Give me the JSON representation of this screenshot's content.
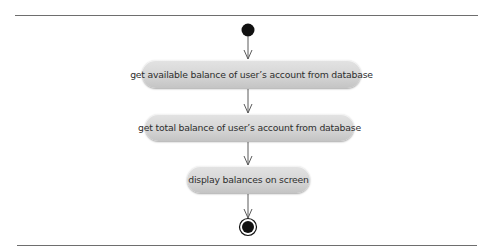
{
  "diagram": {
    "type": "UML activity diagram",
    "initial_node": "initial-node",
    "final_node": "final-node",
    "actions": [
      {
        "label": "get available balance of user’s account from database"
      },
      {
        "label": "get total balance of user’s account from database"
      },
      {
        "label": "display balances on screen"
      }
    ],
    "edges": [
      {
        "from": "initial",
        "to": "action-1"
      },
      {
        "from": "action-1",
        "to": "action-2"
      },
      {
        "from": "action-2",
        "to": "action-3"
      },
      {
        "from": "action-3",
        "to": "final"
      }
    ],
    "colors": {
      "node_fill": "#111111",
      "action_fill": "#d6d6d6",
      "edge": "#5a5a5a",
      "rule": "#6e6e6e",
      "text": "#2e2e2e"
    }
  }
}
